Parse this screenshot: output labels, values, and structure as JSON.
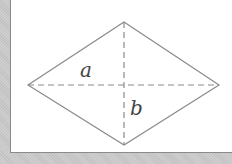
{
  "figure": {
    "shape": "rhombus",
    "labels": {
      "diagonal_a": "a",
      "diagonal_b": "b"
    },
    "colors": {
      "stroke": "#888888",
      "label": "#444444",
      "background": "#ffffff",
      "border": "#c6c6c6"
    }
  }
}
